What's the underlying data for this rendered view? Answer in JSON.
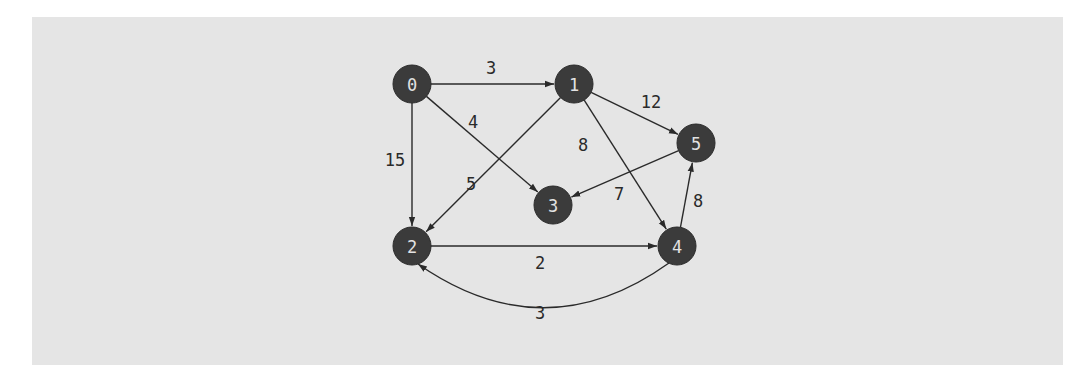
{
  "diagram": {
    "type": "weighted-directed-graph",
    "colors": {
      "background": "#e5e5e5",
      "node_fill": "#3b3b3b",
      "node_text": "#e2e2e2",
      "edge": "#2a2a2a",
      "edge_label": "#2a2a2a"
    },
    "nodes": [
      {
        "id": "0",
        "label": "0",
        "x": 412,
        "y": 84
      },
      {
        "id": "1",
        "label": "1",
        "x": 574,
        "y": 84
      },
      {
        "id": "2",
        "label": "2",
        "x": 412,
        "y": 246
      },
      {
        "id": "3",
        "label": "3",
        "x": 553,
        "y": 205
      },
      {
        "id": "4",
        "label": "4",
        "x": 677,
        "y": 246
      },
      {
        "id": "5",
        "label": "5",
        "x": 696,
        "y": 143
      }
    ],
    "edges": [
      {
        "from": "0",
        "to": "1",
        "weight": "3",
        "label_x": 491,
        "label_y": 68
      },
      {
        "from": "0",
        "to": "2",
        "weight": "15",
        "label_x": 395,
        "label_y": 160
      },
      {
        "from": "0",
        "to": "3",
        "weight": "4",
        "label_x": 473,
        "label_y": 122
      },
      {
        "from": "1",
        "to": "2",
        "weight": "5",
        "label_x": 471,
        "label_y": 184
      },
      {
        "from": "1",
        "to": "4",
        "weight": "8",
        "label_x": 583,
        "label_y": 145
      },
      {
        "from": "1",
        "to": "5",
        "weight": "12",
        "label_x": 651,
        "label_y": 102
      },
      {
        "from": "5",
        "to": "3",
        "weight": "7",
        "label_x": 619,
        "label_y": 194
      },
      {
        "from": "4",
        "to": "5",
        "weight": "8",
        "label_x": 698,
        "label_y": 201
      },
      {
        "from": "2",
        "to": "4",
        "weight": "2",
        "label_x": 540,
        "label_y": 263
      },
      {
        "from": "4",
        "to": "2",
        "weight": "3",
        "label_x": 540,
        "label_y": 313,
        "curved": true
      }
    ]
  }
}
